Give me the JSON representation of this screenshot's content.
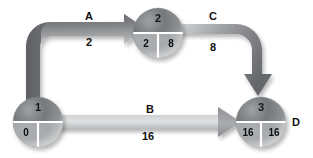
{
  "diagram": {
    "type": "graph",
    "background_color": "#ffffff",
    "nodes": [
      {
        "id": "node-2",
        "top_value": "2",
        "bottom_left_value": "2",
        "bottom_right_value": "8",
        "cx": 158,
        "cy": 33,
        "r": 25,
        "outer_label": ""
      },
      {
        "id": "node-1",
        "top_value": "1",
        "bottom_left_value": "0",
        "bottom_right_value": "",
        "cx": 38,
        "cy": 122,
        "r": 25,
        "outer_label": ""
      },
      {
        "id": "node-3",
        "top_value": "3",
        "bottom_left_value": "16",
        "bottom_right_value": "16",
        "cx": 261,
        "cy": 122,
        "r": 25,
        "outer_label": "D"
      }
    ],
    "edges": [
      {
        "id": "edge-a",
        "name": "A",
        "weight": "2",
        "from": "node-1",
        "to": "node-2",
        "name_x": 88,
        "name_y": 12,
        "weight_x": 89,
        "weight_y": 38,
        "tone": "dark"
      },
      {
        "id": "edge-c",
        "name": "C",
        "weight": "8",
        "from": "node-2",
        "to": "node-3",
        "name_x": 212,
        "name_y": 12,
        "weight_x": 213,
        "weight_y": 42,
        "tone": "dark"
      },
      {
        "id": "edge-b",
        "name": "B",
        "weight": "16",
        "from": "node-1",
        "to": "node-3",
        "name_x": 148,
        "name_y": 107,
        "weight_x": 145,
        "weight_y": 133,
        "tone": "light"
      }
    ],
    "colors": {
      "arrow_dark": "#6f7173",
      "arrow_mid": "#9a9c9e",
      "arrow_light": "#d8dadb",
      "node_dark": "#5d6063",
      "node_light": "#d2d4d6",
      "divider": "#ffffff",
      "text": "#111111"
    }
  }
}
